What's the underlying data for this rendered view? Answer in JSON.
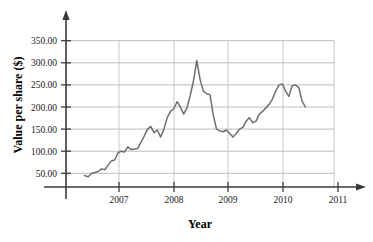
{
  "chart_data": {
    "type": "line",
    "title": "",
    "xlabel": "Year",
    "ylabel": "Value per share ($)",
    "xlim": [
      2006.05,
      2011.45
    ],
    "ylim": [
      0,
      375
    ],
    "grid": true,
    "legend": false,
    "legend_position": "none",
    "x_tick_labels": [
      "2007",
      "2008",
      "2009",
      "2010",
      "2011"
    ],
    "x_ticks": [
      2007,
      2008,
      2009,
      2010,
      2011
    ],
    "y_tick_labels": [
      "50.00",
      "100.00",
      "150.00",
      "200.00",
      "250.00",
      "300.00",
      "350.00"
    ],
    "y_ticks": [
      50,
      100,
      150,
      200,
      250,
      300,
      350
    ],
    "series": [
      {
        "name": "Value per share",
        "color": "#6e6e6e",
        "x": [
          2006.37,
          2006.44,
          2006.5,
          2006.56,
          2006.62,
          2006.68,
          2006.74,
          2006.8,
          2006.86,
          2006.92,
          2006.98,
          2007.04,
          2007.1,
          2007.16,
          2007.22,
          2007.28,
          2007.34,
          2007.4,
          2007.46,
          2007.52,
          2007.58,
          2007.64,
          2007.7,
          2007.76,
          2007.82,
          2007.88,
          2007.94,
          2008.0,
          2008.06,
          2008.12,
          2008.18,
          2008.24,
          2008.3,
          2008.36,
          2008.42,
          2008.48,
          2008.54,
          2008.6,
          2008.66,
          2008.72,
          2008.78,
          2008.84,
          2008.9,
          2008.96,
          2009.02,
          2009.08,
          2009.14,
          2009.2,
          2009.26,
          2009.32,
          2009.38,
          2009.44,
          2009.5,
          2009.56,
          2009.62,
          2009.68,
          2009.74,
          2009.8,
          2009.86,
          2009.92,
          2009.98,
          2010.04,
          2010.1,
          2010.16,
          2010.22,
          2010.28,
          2010.34,
          2010.4
        ],
        "values": [
          45,
          42,
          50,
          52,
          54,
          60,
          58,
          68,
          78,
          80,
          96,
          100,
          98,
          110,
          104,
          105,
          106,
          120,
          134,
          150,
          156,
          142,
          148,
          132,
          150,
          176,
          190,
          196,
          212,
          200,
          184,
          198,
          226,
          260,
          305,
          262,
          236,
          230,
          228,
          182,
          150,
          146,
          144,
          148,
          140,
          132,
          140,
          150,
          154,
          168,
          176,
          164,
          168,
          184,
          190,
          198,
          206,
          218,
          236,
          250,
          252,
          236,
          224,
          248,
          250,
          244,
          214,
          200
        ]
      }
    ]
  },
  "axes": {
    "y_title": "Value per share ($)",
    "x_title": "Year"
  },
  "colors": {
    "line": "#6e6e6e",
    "grid": "#b8b8b8",
    "axis": "#3a3a3a",
    "text": "#1a1a1a",
    "background": "#ffffff"
  },
  "background_artifacts": {
    "top_line": "",
    "mid_line": ""
  }
}
